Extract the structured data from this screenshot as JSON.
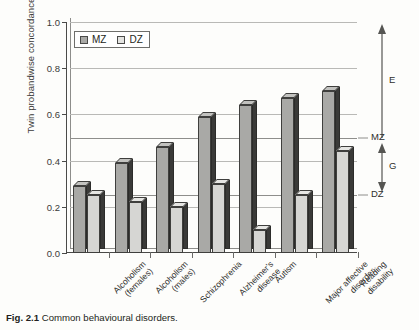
{
  "caption": {
    "figure_number": "Fig. 2.1",
    "text": "Common behavioural disorders."
  },
  "legend": {
    "items": [
      {
        "label": "MZ",
        "color": "#a9a9a6"
      },
      {
        "label": "DZ",
        "color": "#e4e4e1"
      }
    ]
  },
  "annotations": {
    "e_label": "E",
    "mz_label": "MZ",
    "g_label": "G",
    "dz_label": "DZ"
  },
  "chart_data": {
    "type": "bar",
    "title": "Common behavioural disorders",
    "xlabel": "",
    "ylabel": "Twin probandwise concordance",
    "ylim": [
      0.0,
      1.0
    ],
    "yticks": [
      "0.0",
      "0.2",
      "0.4",
      "0.6",
      "0.8",
      "1.0"
    ],
    "ytick_values": [
      0.0,
      0.2,
      0.4,
      0.6,
      0.8,
      1.0
    ],
    "grid": true,
    "reference_lines": [
      {
        "value": 0.5,
        "label": "MZ"
      },
      {
        "value": 0.25,
        "label": "DZ"
      }
    ],
    "legend_position": "top-left",
    "categories": [
      "Alcoholism\n(females)",
      "Alcoholism\n(males)",
      "Schizophrenia",
      "Alzheimer's\ndisease",
      "Autism",
      "Major affective\ndisorder",
      "Reading\ndisability"
    ],
    "series": [
      {
        "name": "MZ",
        "color": "#a9a9a6",
        "values": [
          0.29,
          0.39,
          0.46,
          0.59,
          0.64,
          0.67,
          0.7
        ]
      },
      {
        "name": "DZ",
        "color": "#d6d6d3",
        "values": [
          0.25,
          0.22,
          0.2,
          0.3,
          0.1,
          0.25,
          0.44
        ]
      }
    ],
    "annotation_ranges": [
      {
        "label": "E",
        "from": 0.5,
        "to": 1.0,
        "arrow": "up"
      },
      {
        "label": "G",
        "from": 0.25,
        "to": 0.5,
        "arrow": "double"
      }
    ]
  }
}
